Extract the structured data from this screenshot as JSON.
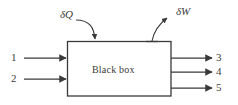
{
  "figure": {
    "kind": "black-box-energy-balance-diagram",
    "background_color": "#ffffff",
    "line_color": "#3a3a3a",
    "box": {
      "caption": "Black box",
      "x": 67,
      "y": 41,
      "width": 104,
      "height": 55
    },
    "inlet_streams": [
      {
        "label": "1",
        "y": 58
      },
      {
        "label": "2",
        "y": 79
      }
    ],
    "outlet_streams": [
      {
        "label": "3",
        "y": 58
      },
      {
        "label": "4",
        "y": 72
      },
      {
        "label": "5",
        "y": 88
      }
    ],
    "heat_flux": {
      "label": "δQ",
      "icon": "curved-arrow-into-box-icon",
      "direction": "into"
    },
    "work_flux": {
      "label": "δW",
      "icon": "curved-arrow-out-of-box-icon",
      "direction": "out"
    }
  }
}
